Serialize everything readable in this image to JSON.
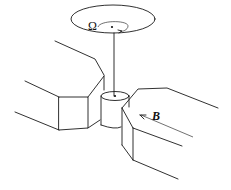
{
  "diagram": {
    "labels": {
      "rotation": "Ω",
      "magnetic_field": "B"
    },
    "components": [
      "rotating-disk",
      "suspension-rod",
      "sample-cylinder",
      "left-pole-piece",
      "right-pole-piece",
      "field-arrow"
    ],
    "colors": {
      "line": "#1a1a1a",
      "background": "#ffffff"
    }
  }
}
